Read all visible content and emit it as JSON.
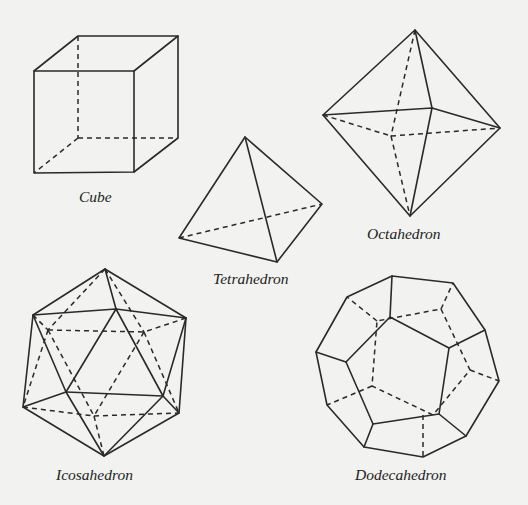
{
  "figure": {
    "solids": [
      {
        "id": "cube",
        "label": "Cube",
        "faces": 6
      },
      {
        "id": "tetrahedron",
        "label": "Tetrahedron",
        "faces": 4
      },
      {
        "id": "octahedron",
        "label": "Octahedron",
        "faces": 8
      },
      {
        "id": "icosahedron",
        "label": "Icosahedron",
        "faces": 20
      },
      {
        "id": "dodecahedron",
        "label": "Dodecahedron",
        "faces": 12
      }
    ]
  },
  "colors": {
    "background": "#f2f2f0",
    "stroke": "#2a2a2a"
  },
  "legend": {
    "solid_line": "visible edge",
    "dashed_line": "hidden edge"
  }
}
